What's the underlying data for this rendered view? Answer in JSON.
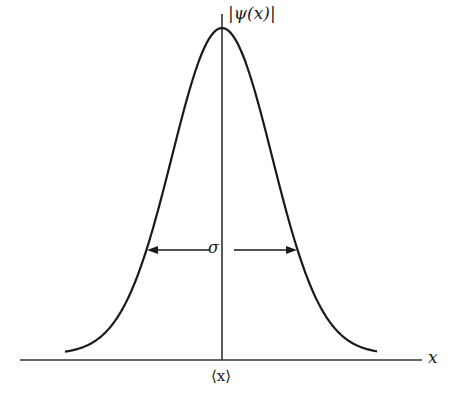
{
  "figure": {
    "y_axis_label": "|ψ(x)|",
    "x_axis_label": "x",
    "mean_label": "⟨x⟩",
    "width_label": "σ",
    "colors": {
      "line": "#1a1a1a",
      "axis": "#333333",
      "background": "#ffffff"
    }
  }
}
